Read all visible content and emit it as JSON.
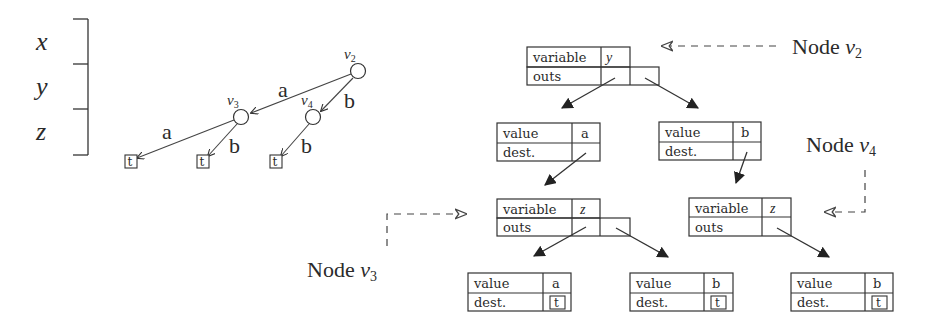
{
  "levels": {
    "items": [
      "x",
      "y",
      "z"
    ]
  },
  "tree": {
    "nodes": [
      {
        "id": "v2",
        "label": "v",
        "sub": "2"
      },
      {
        "id": "v3",
        "label": "v",
        "sub": "3"
      },
      {
        "id": "v4",
        "label": "v",
        "sub": "4"
      }
    ],
    "edges": [
      {
        "from": "v2",
        "to": "v3",
        "label": "a"
      },
      {
        "from": "v2",
        "to": "v4",
        "label": "b"
      },
      {
        "from": "v3",
        "to": "t1",
        "label": "a"
      },
      {
        "from": "v3",
        "to": "t2",
        "label": "b"
      },
      {
        "from": "v4",
        "to": "t3",
        "label": "b"
      }
    ],
    "terminal_label": "t"
  },
  "records": {
    "node_v2": {
      "row1_label": "variable",
      "row1_value": "y",
      "row2_label": "outs"
    },
    "value_a_top": {
      "row1_label": "value",
      "row1_value": "a",
      "row2_label": "dest."
    },
    "value_b_top": {
      "row1_label": "value",
      "row1_value": "b",
      "row2_label": "dest."
    },
    "node_v3": {
      "row1_label": "variable",
      "row1_value": "z",
      "row2_label": "outs"
    },
    "node_v4": {
      "row1_label": "variable",
      "row1_value": "z",
      "row2_label": "outs"
    },
    "leaf_a": {
      "row1_label": "value",
      "row1_value": "a",
      "row2_label": "dest.",
      "dest": "t"
    },
    "leaf_b_mid": {
      "row1_label": "value",
      "row1_value": "b",
      "row2_label": "dest.",
      "dest": "t"
    },
    "leaf_b_right": {
      "row1_label": "value",
      "row1_value": "b",
      "row2_label": "dest.",
      "dest": "t"
    }
  },
  "callouts": {
    "v2": {
      "text": "Node ",
      "var": "v",
      "sub": "2"
    },
    "v3": {
      "text": "Node ",
      "var": "v",
      "sub": "3"
    },
    "v4": {
      "text": "Node ",
      "var": "v",
      "sub": "4"
    }
  }
}
